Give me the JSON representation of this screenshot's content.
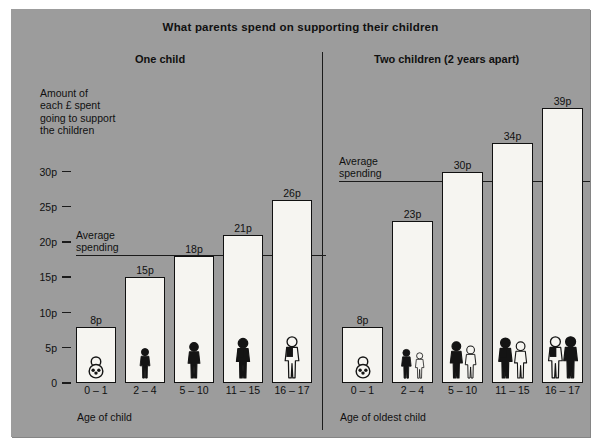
{
  "figure": {
    "title": "What parents spend on supporting their children",
    "background_color": "#9c9c9c",
    "bar_fill_color": "#f6f5f1",
    "line_color": "#111111"
  },
  "y_axis": {
    "caption": "Amount of\neach £ spent\ngoing to support\nthe children",
    "ticks": [
      {
        "label": "30p",
        "value": 30
      },
      {
        "label": "25p",
        "value": 25
      },
      {
        "label": "20p",
        "value": 20
      },
      {
        "label": "15p",
        "value": 15
      },
      {
        "label": "10p",
        "value": 10
      },
      {
        "label": "5p",
        "value": 5
      },
      {
        "label": "0",
        "value": 0
      }
    ]
  },
  "panels": [
    {
      "title": "One child",
      "x_caption": "Age of child",
      "average_label": "Average\nspending",
      "average_value": 18,
      "bars": [
        {
          "category": "0 – 1",
          "value": 8,
          "value_label": "8p",
          "icon": "baby-icon"
        },
        {
          "category": "2 – 4",
          "value": 15,
          "value_label": "15p",
          "icon": "toddler-icon"
        },
        {
          "category": "5 – 10",
          "value": 18,
          "value_label": "18p",
          "icon": "child-icon"
        },
        {
          "category": "11 – 15",
          "value": 21,
          "value_label": "21p",
          "icon": "teen-walking-icon"
        },
        {
          "category": "16 – 17",
          "value": 26,
          "value_label": "26p",
          "icon": "teen-backpack-icon"
        }
      ]
    },
    {
      "title": "Two children (2 years apart)",
      "x_caption": "Age of oldest child",
      "average_label": "Average\nspending",
      "average_value": 28.5,
      "bars": [
        {
          "category": "0 – 1",
          "value": 8,
          "value_label": "8p",
          "icon": "baby-icon"
        },
        {
          "category": "2 – 4",
          "value": 23,
          "value_label": "23p",
          "icon": "two-toddlers-icon"
        },
        {
          "category": "5 – 10",
          "value": 30,
          "value_label": "30p",
          "icon": "two-children-icon"
        },
        {
          "category": "11 – 15",
          "value": 34,
          "value_label": "34p",
          "icon": "two-teens-icon"
        },
        {
          "category": "16 – 17",
          "value": 39,
          "value_label": "39p",
          "icon": "two-older-teens-icon"
        }
      ]
    }
  ],
  "chart_data": {
    "type": "bar",
    "title": "What parents spend on supporting their children",
    "subtitle": "",
    "xlabel": "Age of child / Age of oldest child",
    "ylabel": "Amount of each £ spent going to support the children",
    "categories": [
      "0 – 1",
      "2 – 4",
      "5 – 10",
      "11 – 15",
      "16 – 17"
    ],
    "series": [
      {
        "name": "One child",
        "values": [
          8,
          15,
          18,
          21,
          26
        ],
        "value_labels": [
          "8p",
          "15p",
          "18p",
          "21p",
          "26p"
        ]
      },
      {
        "name": "Two children (2 years apart)",
        "values": [
          8,
          23,
          30,
          34,
          39
        ],
        "value_labels": [
          "8p",
          "23p",
          "30p",
          "34p",
          "39p"
        ]
      }
    ],
    "annotations": [
      {
        "text": "Average spending",
        "panel": "One child",
        "value": 18
      },
      {
        "text": "Average spending",
        "panel": "Two children (2 years apart)",
        "value": 28.5
      }
    ],
    "ylim": [
      0,
      42
    ],
    "ytick_labels": [
      "0",
      "5p",
      "10p",
      "15p",
      "20p",
      "25p",
      "30p"
    ],
    "ytick_values": [
      0,
      5,
      10,
      15,
      20,
      25,
      30
    ],
    "grid": false,
    "legend": "none",
    "units": "pence per pound"
  }
}
